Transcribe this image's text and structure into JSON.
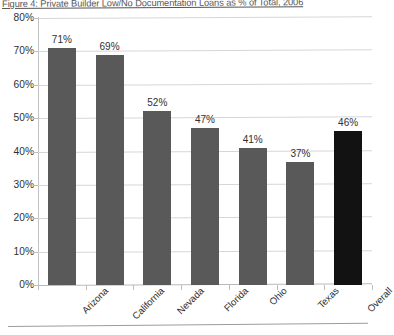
{
  "figure": {
    "title": "Figure 4: Private Builder Low/No Documentation Loans as % of Total, 2006"
  },
  "chart_data": {
    "type": "bar",
    "title": "Figure 4: Private Builder Low/No Documentation Loans as % of Total, 2006",
    "xlabel": "",
    "ylabel": "",
    "categories": [
      "Arizona",
      "California",
      "Nevada",
      "Florida",
      "Ohio",
      "Texas",
      "Overall"
    ],
    "values": [
      71,
      69,
      52,
      47,
      41,
      37,
      46
    ],
    "value_labels": [
      "71%",
      "69%",
      "52%",
      "47%",
      "41%",
      "37%",
      "46%"
    ],
    "ylim": [
      0,
      80
    ],
    "ytick_labels": [
      "80%",
      "70%",
      "60%",
      "50%",
      "40%",
      "30%",
      "20%",
      "10%",
      "0%"
    ],
    "ytick_values": [
      80,
      70,
      60,
      50,
      40,
      30,
      20,
      10,
      0
    ],
    "grid": true,
    "legend": "none",
    "bar_colors": [
      "#595959",
      "#595959",
      "#595959",
      "#595959",
      "#595959",
      "#595959",
      "#121212"
    ],
    "series_color_default": "#595959",
    "series_color_highlight": "#121212",
    "gridline_color": "#d6d6d6",
    "axis_color": "#bdbdbd"
  }
}
